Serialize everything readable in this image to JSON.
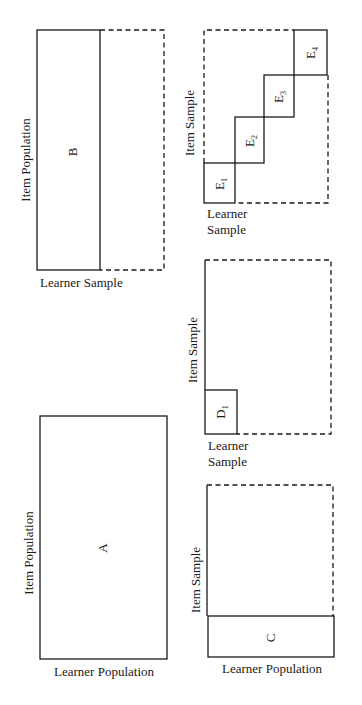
{
  "panels": {
    "A": {
      "cell_label": "A",
      "x_axis_label": "Learner Population",
      "y_axis_label": "Item Population"
    },
    "B": {
      "cell_label": "B",
      "x_axis_label": "Learner Sample",
      "y_axis_label": "Item Population"
    },
    "C": {
      "cell_label": "C",
      "x_axis_label": "Learner Population",
      "y_axis_label": "Item Sample"
    },
    "D": {
      "cell_label": "D",
      "cell_subscript": "1",
      "x_axis_label_line1": "Learner",
      "x_axis_label_line2": "Sample",
      "y_axis_label": "Item Sample"
    },
    "E": {
      "cells": [
        {
          "label": "E",
          "subscript": "1"
        },
        {
          "label": "E",
          "subscript": "2"
        },
        {
          "label": "E",
          "subscript": "3"
        },
        {
          "label": "E",
          "subscript": "4"
        }
      ],
      "x_axis_label_line1": "Learner",
      "x_axis_label_line2": "Sample",
      "y_axis_label": "Item Sample"
    }
  },
  "colors": {
    "line": "#1a1a1a",
    "background": "#ffffff"
  }
}
